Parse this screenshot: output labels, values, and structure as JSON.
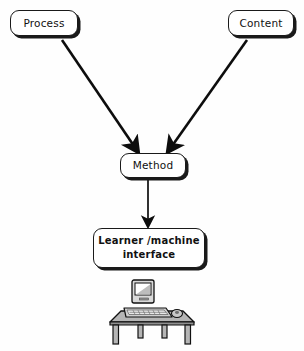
{
  "diagram": {
    "background_color": "#fefefe",
    "stroke_color": "#1a1a1a",
    "nodes": [
      {
        "id": "process",
        "label": "Process",
        "shape": "rounded-rectangle-shadow"
      },
      {
        "id": "content",
        "label": "Content",
        "shape": "rounded-rectangle-shadow"
      },
      {
        "id": "method",
        "label": "Method",
        "shape": "rounded-rectangle-shadow"
      },
      {
        "id": "interface",
        "label": "Learner /machine\ninterface",
        "shape": "rounded-rectangle-shadow"
      }
    ],
    "edges": [
      {
        "id": "process-to-method",
        "from": "process",
        "to": "method",
        "style": "solid-arrow",
        "direction": "diagonal-down-right"
      },
      {
        "id": "content-to-method",
        "from": "content",
        "to": "method",
        "style": "solid-arrow",
        "direction": "diagonal-down-left"
      },
      {
        "id": "method-to-interface",
        "from": "method",
        "to": "interface",
        "style": "solid-arrow",
        "direction": "down"
      }
    ],
    "illustration": {
      "id": "computer-on-desk",
      "description": "Desktop computer with monitor, keyboard and mouse on a table"
    }
  }
}
